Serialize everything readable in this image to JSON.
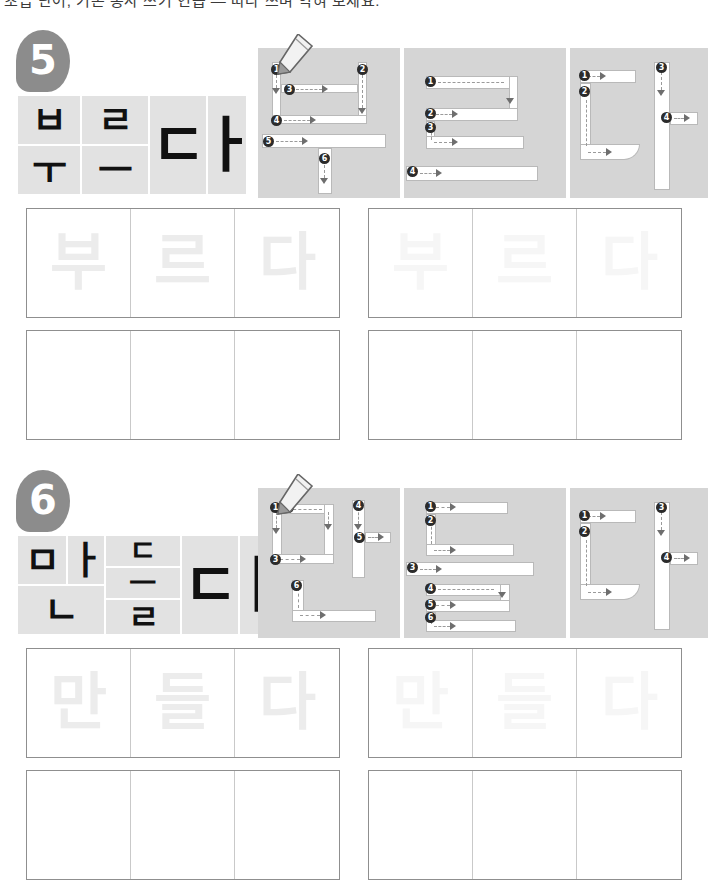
{
  "page": {
    "clipped_header_text": "초급 단어, 기본 동사 쓰기 연습 — 따라 쓰며 익혀 보세요.",
    "paper_color": "#ffffff",
    "badge_color": "#8c8c8c",
    "panel_bg": "#d5d5d5",
    "tile_bg": "#e2e2e2",
    "stroke_fill": "#ffffff",
    "ghost_dark": "#ececec",
    "ghost_light": "#f6f6f6"
  },
  "sections": [
    {
      "id": "section-5",
      "number": "5",
      "word": "부르다",
      "syllables": [
        "부",
        "르",
        "다"
      ],
      "tiles": [
        {
          "jamo": "ㅂ",
          "size": 38
        },
        {
          "jamo": "ㅜ",
          "size": 38
        },
        {
          "jamo": "ㄹ",
          "size": 38
        },
        {
          "jamo": "ㅡ",
          "size": 38
        },
        {
          "jamo": "ㄷ",
          "size": 60
        },
        {
          "jamo": "ㅏ",
          "size": 60
        }
      ],
      "stroke_panels": [
        {
          "syllable": "부",
          "stroke_count": 6,
          "numbers": [
            "1",
            "2",
            "3",
            "4",
            "5",
            "6"
          ],
          "pen": true
        },
        {
          "syllable": "르",
          "stroke_count": 4,
          "numbers": [
            "1",
            "2",
            "3",
            "4"
          ],
          "pen": false
        },
        {
          "syllable": "다",
          "stroke_count": 4,
          "numbers": [
            "1",
            "2",
            "3",
            "4"
          ],
          "pen": false
        }
      ],
      "grids": [
        {
          "style": "trace-dark",
          "cells": [
            "부",
            "르",
            "다"
          ]
        },
        {
          "style": "trace-light",
          "cells": [
            "부",
            "르",
            "다"
          ]
        },
        {
          "style": "blank",
          "cells": [
            "",
            "",
            ""
          ]
        },
        {
          "style": "blank",
          "cells": [
            "",
            "",
            ""
          ]
        }
      ]
    },
    {
      "id": "section-6",
      "number": "6",
      "word": "만들다",
      "syllables": [
        "만",
        "들",
        "다"
      ],
      "tiles": [
        {
          "jamo": "ㅁ",
          "size": 38
        },
        {
          "jamo": "ㅏ",
          "size": 38
        },
        {
          "jamo": "ㄴ",
          "size": 38
        },
        {
          "jamo": "ㄷ",
          "size": 30
        },
        {
          "jamo": "ㅡ",
          "size": 30
        },
        {
          "jamo": "ㄹ",
          "size": 34
        },
        {
          "jamo": "ㄷ",
          "size": 60
        },
        {
          "jamo": "ㅏ",
          "size": 60
        }
      ],
      "stroke_panels": [
        {
          "syllable": "만",
          "stroke_count": 6,
          "numbers": [
            "1",
            "2",
            "3",
            "4",
            "5",
            "6"
          ],
          "pen": true
        },
        {
          "syllable": "들",
          "stroke_count": 6,
          "numbers": [
            "1",
            "2",
            "3",
            "4",
            "5",
            "6"
          ],
          "pen": false
        },
        {
          "syllable": "다",
          "stroke_count": 4,
          "numbers": [
            "1",
            "2",
            "3",
            "4"
          ],
          "pen": false
        }
      ],
      "grids": [
        {
          "style": "trace-dark",
          "cells": [
            "만",
            "들",
            "다"
          ]
        },
        {
          "style": "trace-light",
          "cells": [
            "만",
            "들",
            "다"
          ]
        },
        {
          "style": "blank",
          "cells": [
            "",
            "",
            ""
          ]
        },
        {
          "style": "blank",
          "cells": [
            "",
            "",
            ""
          ]
        }
      ]
    }
  ]
}
